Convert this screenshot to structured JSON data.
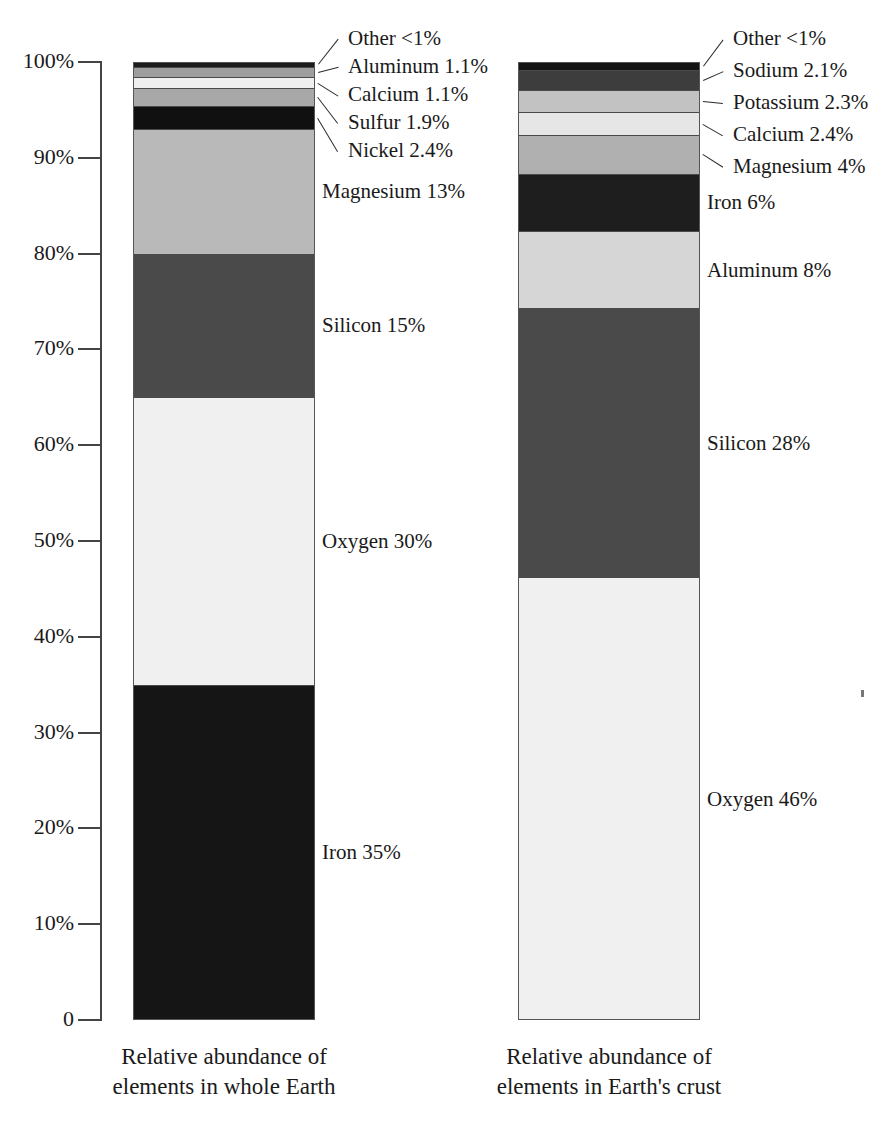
{
  "chart_data": {
    "type": "bar",
    "subtype": "stacked-percentage",
    "title": "",
    "xlabel": "",
    "ylabel": "",
    "ylim": [
      0,
      100
    ],
    "grid": false,
    "legend": "none",
    "axis": {
      "tick_labels": [
        "100%",
        "90%",
        "80%",
        "70%",
        "60%",
        "50%",
        "40%",
        "30%",
        "20%",
        "10%",
        "0"
      ],
      "tick_values": [
        100,
        90,
        80,
        70,
        60,
        50,
        40,
        30,
        20,
        10,
        0
      ],
      "unit": "%"
    },
    "categories": [
      "Relative abundance of elements in whole Earth",
      "Relative abundance of elements in Earth's crust"
    ],
    "series": [
      {
        "name": "Whole Earth",
        "caption_line1": "Relative abundance of",
        "caption_line2": "elements in whole Earth",
        "segments": [
          {
            "element": "Iron",
            "label": "Iron  35%",
            "value": 35,
            "color": "#151515",
            "label_style": "inner"
          },
          {
            "element": "Oxygen",
            "label": "Oxygen  30%",
            "value": 30,
            "color": "#f0f0f0",
            "label_style": "inner"
          },
          {
            "element": "Silicon",
            "label": "Silicon  15%",
            "value": 15,
            "color": "#4a4a4a",
            "label_style": "inner"
          },
          {
            "element": "Magnesium",
            "label": "Magnesium 13%",
            "value": 13,
            "color": "#b9b9b9",
            "label_style": "inner"
          },
          {
            "element": "Nickel",
            "label": "Nickel  2.4%",
            "value": 2.4,
            "color": "#101010",
            "label_style": "callout"
          },
          {
            "element": "Sulfur",
            "label": "Sulfur  1.9%",
            "value": 1.9,
            "color": "#a8a8a8",
            "label_style": "callout"
          },
          {
            "element": "Calcium",
            "label": "Calcium  1.1%",
            "value": 1.1,
            "color": "#efefef",
            "label_style": "callout"
          },
          {
            "element": "Aluminum",
            "label": "Aluminum  1.1%",
            "value": 1.1,
            "color": "#9e9e9e",
            "label_style": "callout"
          },
          {
            "element": "Other",
            "label": "Other  <1%",
            "value": 0.5,
            "color": "#1c1c1c",
            "label_style": "callout"
          }
        ]
      },
      {
        "name": "Earth's crust",
        "caption_line1": "Relative abundance of",
        "caption_line2": "elements in Earth's crust",
        "segments": [
          {
            "element": "Oxygen",
            "label": "Oxygen  46%",
            "value": 46,
            "color": "#f0f0f0",
            "label_style": "inner"
          },
          {
            "element": "Silicon",
            "label": "Silicon  28%",
            "value": 28,
            "color": "#4a4a4a",
            "label_style": "inner"
          },
          {
            "element": "Aluminum",
            "label": "Aluminum  8%",
            "value": 8,
            "color": "#d6d6d6",
            "label_style": "inner"
          },
          {
            "element": "Iron",
            "label": "Iron  6%",
            "value": 6,
            "color": "#1e1e1e",
            "label_style": "inner"
          },
          {
            "element": "Magnesium",
            "label": "Magnesium  4%",
            "value": 4,
            "color": "#b0b0b0",
            "label_style": "callout"
          },
          {
            "element": "Calcium",
            "label": "Calcium  2.4%",
            "value": 2.4,
            "color": "#e6e6e6",
            "label_style": "callout"
          },
          {
            "element": "Potassium",
            "label": "Potassium  2.3%",
            "value": 2.3,
            "color": "#c2c2c2",
            "label_style": "callout"
          },
          {
            "element": "Sodium",
            "label": "Sodium  2.1%",
            "value": 2.1,
            "color": "#3d3d3d",
            "label_style": "callout"
          },
          {
            "element": "Other",
            "label": "Other  <1%",
            "value": 0.8,
            "color": "#141414",
            "label_style": "callout"
          }
        ]
      }
    ]
  }
}
